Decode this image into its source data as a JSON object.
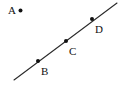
{
  "figure": {
    "background_color": "#ffffff",
    "width": 126,
    "height": 99,
    "line": {
      "name": "line-through-bcd",
      "color": "#2b2b2b",
      "stroke_width": 1.1,
      "x1": 14,
      "y1": 80,
      "x2": 117,
      "y2": 3
    },
    "points": [
      {
        "id": "A",
        "label": "A",
        "dot_x": 20.5,
        "dot_y": 10.5,
        "dot_radius": 2.0,
        "dot_color": "#111111",
        "label_x": 8,
        "label_y": 5,
        "on_line": false
      },
      {
        "id": "B",
        "label": "B",
        "dot_x": 38,
        "dot_y": 61,
        "dot_radius": 2.0,
        "dot_color": "#111111",
        "label_x": 41,
        "label_y": 66,
        "on_line": true
      },
      {
        "id": "C",
        "label": "C",
        "dot_x": 66,
        "dot_y": 41,
        "dot_radius": 2.0,
        "dot_color": "#111111",
        "label_x": 69,
        "label_y": 46,
        "on_line": true
      },
      {
        "id": "D",
        "label": "D",
        "dot_x": 92,
        "dot_y": 19,
        "dot_radius": 2.0,
        "dot_color": "#111111",
        "label_x": 95,
        "label_y": 24,
        "on_line": true
      }
    ]
  }
}
